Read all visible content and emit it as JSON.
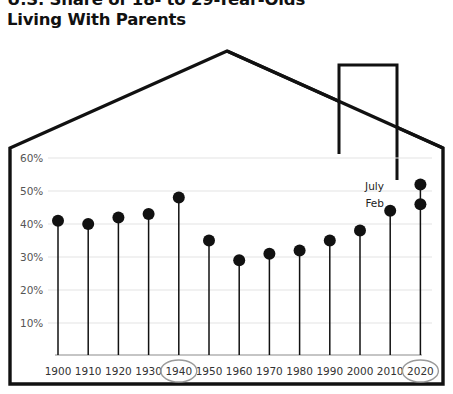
{
  "title": {
    "line1": "U.S. Share of 18- to 29-Year-Olds",
    "line2": "Living With Parents",
    "full": "U.S. Share of 18- to 29-Year-Olds\nLiving With Parents"
  },
  "colors": {
    "ink": "#111111",
    "grid": "#e3e3e3",
    "axis": "#8c8c8c",
    "highlight_ring": "#9a9a9a",
    "background": "#ffffff"
  },
  "annotations": {
    "july_label": "July",
    "feb_label": "Feb"
  },
  "highlighted_ticks": [
    "1940",
    "2020"
  ],
  "chart_data": {
    "type": "scatter",
    "title": "U.S. Share of 18- to 29-Year-Olds Living With Parents",
    "xlabel": "",
    "ylabel": "",
    "grid": true,
    "legend": "none",
    "marker": "stem-and-dot",
    "xlim": [
      1900,
      2020
    ],
    "ylim": [
      0,
      65
    ],
    "ytick_labels": [
      "10%",
      "20%",
      "30%",
      "40%",
      "50%",
      "60%"
    ],
    "ytick_values": [
      10,
      20,
      30,
      40,
      50,
      60
    ],
    "categories": [
      "1900",
      "1910",
      "1920",
      "1930",
      "1940",
      "1950",
      "1960",
      "1970",
      "1980",
      "1990",
      "2000",
      "2010",
      "2020"
    ],
    "values": [
      41,
      40,
      42,
      43,
      48,
      35,
      29,
      31,
      32,
      35,
      38,
      44,
      46
    ],
    "extra_points": [
      {
        "category": "2020",
        "label": "July",
        "value": 52
      },
      {
        "category": "2020",
        "label": "Feb",
        "value": 46
      }
    ]
  }
}
